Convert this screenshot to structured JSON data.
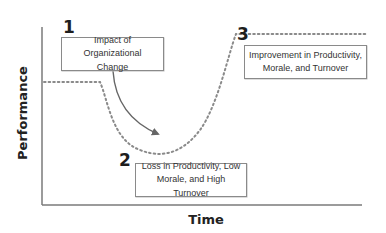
{
  "diagram": {
    "axes": {
      "y_label": "Performance",
      "x_label": "Time"
    },
    "stages": [
      {
        "number": "1",
        "label": "Impact of Organizational Change"
      },
      {
        "number": "2",
        "label": "Loss in Productivity, Low Morale, and High Turnover"
      },
      {
        "number": "3",
        "label": "Improvement in Productivity, Morale, and Turnover"
      }
    ],
    "curve": {
      "style": "dotted",
      "phases": [
        "baseline",
        "decline",
        "trough",
        "recovery",
        "new-higher-plateau"
      ]
    },
    "colors": {
      "axis": "#7a7a7a",
      "curve": "#8a8a8a",
      "arrow": "#666666",
      "box_border": "#8a8a8a",
      "text": "#222222"
    }
  }
}
